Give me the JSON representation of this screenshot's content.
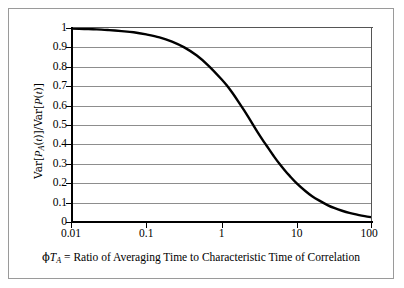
{
  "figure": {
    "background_color": "#ffffff",
    "frame_color": "#9a9a9a",
    "axis_color": "#000000",
    "gridline_color": "#8d8d8d",
    "curve_color": "#000000"
  },
  "chart_data": {
    "type": "line",
    "title": "",
    "subtitle": "",
    "xlabel": "ϕT_A = Ratio of Averaging Time to Characteristic Time of Correlation",
    "xlabel_parts": {
      "phi": "ϕ",
      "T": "T",
      "subscript": "A",
      "rest": " = Ratio of Averaging Time to Characteristic Time of Correlation"
    },
    "ylabel": "Var[P_A(t)]/Var[P(t)]",
    "ylabel_parts": {
      "prefix": "Var[",
      "P1": "P",
      "sub1": "A",
      "mid": "(t)]/Var[",
      "P2": "P",
      "suffix": "(t)]"
    },
    "xscale": "log",
    "yscale": "linear",
    "xlim": [
      0.01,
      100
    ],
    "ylim": [
      0,
      1
    ],
    "grid": "horizontal",
    "legend": "none",
    "xticks": [
      "0.01",
      "0.1",
      "1",
      "10",
      "100"
    ],
    "xtick_values": [
      0.01,
      0.1,
      1,
      10,
      100
    ],
    "yticks": [
      "1",
      "0.9",
      "0.8",
      "0.7",
      "0.6",
      "0.5",
      "0.4",
      "0.3",
      "0.2",
      "0.1",
      "0"
    ],
    "ytick_values": [
      1,
      0.9,
      0.8,
      0.7,
      0.6,
      0.5,
      0.4,
      0.3,
      0.2,
      0.1,
      0
    ],
    "series": [
      {
        "name": "Variance reduction factor",
        "x": [
          0.01,
          0.015,
          0.022,
          0.032,
          0.047,
          0.068,
          0.1,
          0.15,
          0.22,
          0.32,
          0.47,
          0.68,
          1.0,
          1.2,
          1.4,
          1.7,
          2.0,
          2.5,
          3.0,
          3.5,
          4.0,
          5.0,
          6.0,
          7.0,
          8.0,
          10.0,
          13.0,
          16.0,
          20.0,
          26.0,
          32.0,
          40.0,
          50.0,
          65.0,
          80.0,
          100.0
        ],
        "y": [
          0.997,
          0.995,
          0.993,
          0.989,
          0.984,
          0.978,
          0.967,
          0.952,
          0.93,
          0.9,
          0.858,
          0.804,
          0.736,
          0.7,
          0.665,
          0.617,
          0.575,
          0.515,
          0.465,
          0.425,
          0.392,
          0.337,
          0.296,
          0.264,
          0.239,
          0.199,
          0.16,
          0.133,
          0.11,
          0.086,
          0.071,
          0.058,
          0.047,
          0.037,
          0.03,
          0.024
        ]
      }
    ]
  }
}
